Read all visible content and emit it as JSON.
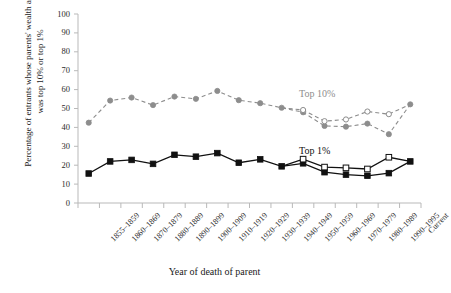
{
  "chart_data": {
    "type": "line",
    "title": "",
    "xlabel": "Year of death of parent",
    "ylabel": "Percentage of entrants whose parents' wealth at death was top 10% or top 1%",
    "ylim": [
      0,
      100
    ],
    "ytick_step": 10,
    "yticks": [
      "100",
      "90",
      "80",
      "70",
      "60",
      "50",
      "40",
      "30",
      "20",
      "10",
      "0"
    ],
    "grid": false,
    "legend_position": "inline-annotation",
    "categories": [
      "1855–1859",
      "1860–1869",
      "1870–1879",
      "1880–1889",
      "1890–1899",
      "1900–1909",
      "1910–1919",
      "1920–1929",
      "1930–1939",
      "1940–1949",
      "1950–1959",
      "1960–1969",
      "1970–1979",
      "1980–1989",
      "1990–1995",
      "Current"
    ],
    "series": [
      {
        "name": "Top 10%",
        "color": "#8d8d8d",
        "style": "dashed",
        "marker": "filled-circle",
        "values": [
          42.5,
          54.2,
          55.8,
          51.8,
          56.3,
          55.1,
          59.3,
          54.4,
          52.8,
          50.4,
          48.0,
          40.8,
          40.4,
          42.0,
          36.4,
          52.2
        ]
      },
      {
        "name": "Top 10% (alternative)",
        "color": "#8d8d8d",
        "style": "dashed",
        "marker": "hollow-circle",
        "values": [
          null,
          null,
          null,
          null,
          null,
          null,
          null,
          null,
          null,
          null,
          49.2,
          43.3,
          44.2,
          48.4,
          47.0,
          null
        ]
      },
      {
        "name": "Top 1%",
        "color": "#111111",
        "style": "solid",
        "marker": "filled-square",
        "values": [
          15.6,
          22.0,
          22.8,
          20.7,
          25.5,
          24.5,
          26.4,
          21.3,
          23.1,
          19.4,
          21.0,
          16.3,
          15.0,
          14.4,
          15.8,
          22.0
        ]
      },
      {
        "name": "Top 1% (alternative)",
        "color": "#111111",
        "style": "solid",
        "marker": "hollow-square",
        "values": [
          null,
          null,
          null,
          null,
          null,
          null,
          null,
          null,
          null,
          null,
          23.2,
          19.0,
          18.6,
          18.0,
          24.2,
          null
        ]
      }
    ],
    "annotations": [
      {
        "text": "Top 10%",
        "color": "#8d8d8d"
      },
      {
        "text": "Top 1%",
        "color": "#111111"
      }
    ]
  }
}
